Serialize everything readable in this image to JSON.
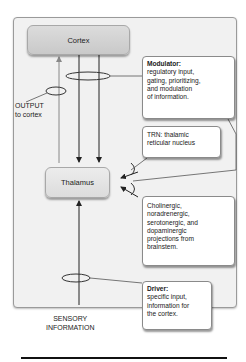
{
  "diagram": {
    "nodes": {
      "cortex": "Cortex",
      "thalamus": "Thalamus"
    },
    "labels": {
      "output_line1": "OUTPUT",
      "output_line2": "to cortex",
      "sensory_line1": "SENSORY",
      "sensory_line2": "INFORMATION"
    },
    "notes": {
      "modulator": {
        "title": "Modulator:",
        "lines": [
          "regulatory input,",
          "gating, prioritizing,",
          "and modulation",
          "of information."
        ]
      },
      "trn": {
        "lines": [
          "TRN: thalamic",
          "reticular nucleus"
        ]
      },
      "cholinergic": {
        "lines": [
          "Cholinergic,",
          "noradrenergic,",
          "serotonergic, and",
          "dopaminergic",
          "projections from",
          "brainstem."
        ]
      },
      "driver": {
        "title": "Driver:",
        "lines": [
          "specific input,",
          "information for",
          "the cortex."
        ]
      }
    },
    "colors": {
      "panel_bg": "#f1f1f1",
      "node_fill": "#d3d3d3",
      "note_bg": "#ffffff",
      "line": "#222222"
    }
  }
}
